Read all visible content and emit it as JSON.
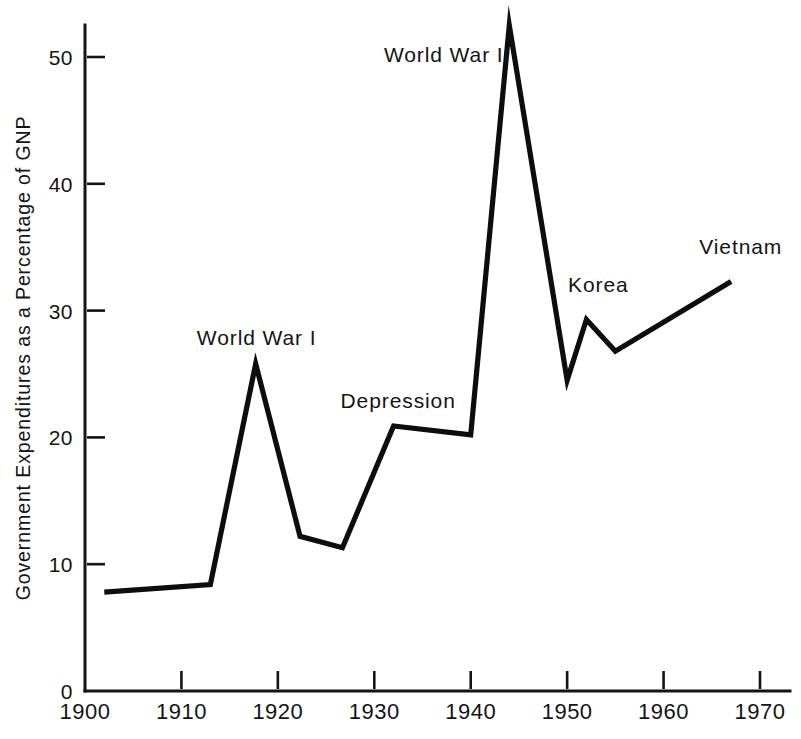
{
  "chart_data": {
    "type": "line",
    "title": "",
    "subtitle": "",
    "xlabel": "",
    "ylabel": "Government Expenditures as a Percentage of GNP",
    "xlim": [
      1900,
      1972
    ],
    "ylim": [
      0,
      53
    ],
    "grid": false,
    "legend": "none",
    "x_ticks": [
      1900,
      1910,
      1920,
      1930,
      1940,
      1950,
      1960,
      1970
    ],
    "x_tick_labels": [
      "1900",
      "1910",
      "1920",
      "1930",
      "1940",
      "1950",
      "1960",
      "1970"
    ],
    "y_ticks": [
      0,
      10,
      20,
      30,
      40,
      50
    ],
    "y_tick_labels": [
      "0",
      "10",
      "20",
      "30",
      "40",
      "50"
    ],
    "series": [
      {
        "name": "Government Expenditures as a Percentage of GNP",
        "color": "#0d0d0d",
        "x": [
          1902,
          1913,
          1917.7,
          1922.3,
          1926.7,
          1932,
          1940,
          1944,
          1950,
          1952,
          1955,
          1967
        ],
        "values": [
          7.8,
          8.4,
          25.8,
          12.2,
          11.3,
          20.9,
          20.2,
          52.5,
          24.5,
          29.3,
          26.8,
          32.3
        ]
      }
    ],
    "annotations": [
      {
        "text": "World War I",
        "x": 1911.6,
        "y": 27.3
      },
      {
        "text": "Depression",
        "x": 1926.5,
        "y": 22.3
      },
      {
        "text": "World War II",
        "x": 1931.0,
        "y": 49.6
      },
      {
        "text": "Korea",
        "x": 1950.1,
        "y": 31.5
      },
      {
        "text": "Vietnam",
        "x": 1963.7,
        "y": 34.5
      }
    ]
  },
  "axis": {
    "y_title": "Government Expenditures as a Percentage of GNP"
  },
  "colors": {
    "line": "#0d0d0d",
    "axis": "#141414",
    "background": "#ffffff"
  }
}
